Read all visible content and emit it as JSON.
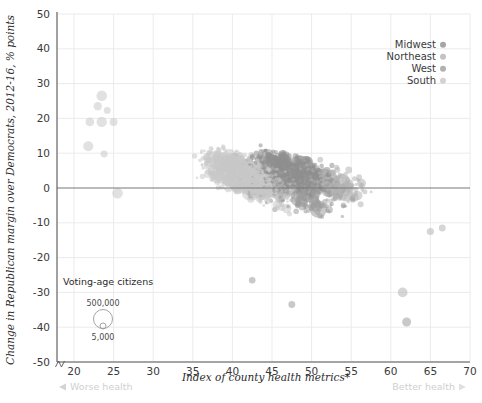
{
  "chart_data": {
    "type": "scatter",
    "title": "",
    "xlabel": "Index of county health metrics*",
    "ylabel": "Change in Republican margin over Democrats, 2012-16, % points",
    "xlim": [
      18,
      70
    ],
    "ylim": [
      -50,
      50
    ],
    "xticks": [
      20,
      25,
      30,
      35,
      40,
      45,
      50,
      55,
      60,
      65,
      70
    ],
    "yticks": [
      -50,
      -40,
      -30,
      -20,
      -10,
      0,
      10,
      20,
      30,
      40,
      50
    ],
    "grid": true,
    "zero_line": 0,
    "axis_break": true,
    "legend_position": "top-right",
    "size_encoding": "Voting-age citizens",
    "size_legend": {
      "outer": "500,000",
      "inner": "5,000"
    },
    "x_axis_annotations": {
      "left": "Worse health",
      "right": "Better health"
    },
    "correlation": "negative",
    "series": [
      {
        "name": "Midwest",
        "color": "#8f8f8f",
        "n": 1055
      },
      {
        "name": "Northeast",
        "color": "#b4b4b4",
        "n": 217
      },
      {
        "name": "West",
        "color": "#9d9d9d",
        "n": 414
      },
      {
        "name": "South",
        "color": "#c8c8c8",
        "n": 1422
      }
    ],
    "trend_description": "Counties with worse health metrics (low index) swung more strongly Republican; counties with better health metrics (high index) swung toward Democrats.",
    "notable_points": [
      {
        "x": 23.5,
        "y": 26.5,
        "region": "South"
      },
      {
        "x": 23.0,
        "y": 23.5,
        "region": "South"
      },
      {
        "x": 24.2,
        "y": 22.3,
        "region": "South"
      },
      {
        "x": 22.0,
        "y": 19.0,
        "region": "South"
      },
      {
        "x": 23.5,
        "y": 19.0,
        "region": "South"
      },
      {
        "x": 25.0,
        "y": 19.0,
        "region": "South"
      },
      {
        "x": 23.8,
        "y": 9.8,
        "region": "South"
      },
      {
        "x": 21.8,
        "y": 12.0,
        "region": "South"
      },
      {
        "x": 25.5,
        "y": -1.5,
        "region": "South"
      },
      {
        "x": 42.5,
        "y": -26.5,
        "region": "West"
      },
      {
        "x": 47.5,
        "y": -33.5,
        "region": "West"
      },
      {
        "x": 61.5,
        "y": -30.0,
        "region": "Northeast"
      },
      {
        "x": 62.0,
        "y": -38.5,
        "region": "West"
      },
      {
        "x": 66.5,
        "y": -11.5,
        "region": "Northeast"
      },
      {
        "x": 65.0,
        "y": -12.5,
        "region": "Northeast"
      }
    ]
  },
  "axes": {
    "y_title": "Change in Republican margin over Democrats, 2012-16, % points",
    "x_title": "Index of county health metrics*",
    "x_ticks": [
      "20",
      "25",
      "30",
      "35",
      "40",
      "45",
      "50",
      "55",
      "60",
      "65",
      "70"
    ],
    "y_ticks": [
      "50",
      "40",
      "30",
      "20",
      "10",
      "0",
      "-10",
      "-20",
      "-30",
      "-40",
      "-50"
    ],
    "left_annotation": "Worse health",
    "right_annotation": "Better health",
    "left_arrow": "◀",
    "right_arrow": "▶"
  },
  "legend": {
    "items": [
      {
        "label": "Midwest",
        "color": "#8f8f8f"
      },
      {
        "label": "Northeast",
        "color": "#b4b4b4"
      },
      {
        "label": "West",
        "color": "#9d9d9d"
      },
      {
        "label": "South",
        "color": "#c8c8c8"
      }
    ]
  },
  "size_legend": {
    "title": "Voting-age citizens",
    "large_label": "500,000",
    "small_label": "5,000"
  },
  "colors": {
    "grid": "#ebebeb",
    "axis": "#555555",
    "zero_line": "#777777",
    "text": "#3a3a3a",
    "muted_text": "#cfcfcf"
  }
}
